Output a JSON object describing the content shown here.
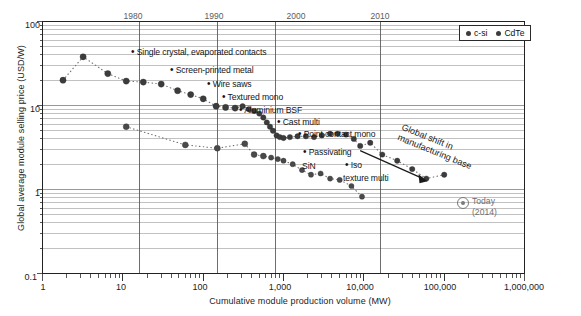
{
  "figure": {
    "background": "#ffffff",
    "frame_color": "#222222",
    "grid_color": "#8e8e8e",
    "marker_color": "#3c3c3c",
    "year_tick_color": "#5d5d5d"
  },
  "chart_data": {
    "type": "scatter",
    "title": "",
    "xlabel": "Cumulative module production volume (MW)",
    "ylabel": "Global average module selling price (USD/W)",
    "xscale": "log",
    "yscale": "log",
    "xlim": [
      1,
      1000000
    ],
    "ylim": [
      0.1,
      100
    ],
    "grid": true,
    "legend_position": "top-right",
    "xticklabels": [
      "1",
      "10",
      "100",
      "1,000",
      "10,000",
      "100,000",
      "1,000,000"
    ],
    "xtickvalues": [
      1,
      10,
      100,
      1000,
      10000,
      100000,
      1000000
    ],
    "yticklabels": [
      "0.1",
      "1",
      "10",
      "100"
    ],
    "ytickvalues": [
      0.1,
      1,
      10,
      100
    ],
    "secondary_axis": {
      "label": "year",
      "position": "top",
      "ticks": [
        {
          "label": "1980",
          "x": 16
        },
        {
          "label": "1990",
          "x": 150
        },
        {
          "label": "2000",
          "x": 800
        },
        {
          "label": "2010",
          "x": 16000
        }
      ]
    },
    "series": [
      {
        "name": "c-si",
        "color": "#3c3c3c",
        "points": [
          [
            1.8,
            20
          ],
          [
            3.2,
            38
          ],
          [
            6.5,
            24
          ],
          [
            11,
            19.5
          ],
          [
            18,
            19
          ],
          [
            30,
            18
          ],
          [
            48,
            15
          ],
          [
            70,
            13.5
          ],
          [
            100,
            12
          ],
          [
            145,
            9.8
          ],
          [
            190,
            9.5
          ],
          [
            250,
            9.3
          ],
          [
            310,
            9.8
          ],
          [
            370,
            9.0
          ],
          [
            430,
            8.6
          ],
          [
            500,
            8.0
          ],
          [
            560,
            7.2
          ],
          [
            620,
            6.3
          ],
          [
            680,
            5.6
          ],
          [
            740,
            5.0
          ],
          [
            820,
            4.4
          ],
          [
            900,
            4.2
          ],
          [
            1000,
            4.1
          ],
          [
            1200,
            4.2
          ],
          [
            1500,
            4.3
          ],
          [
            1900,
            4.3
          ],
          [
            2400,
            4.2
          ],
          [
            3000,
            4.4
          ],
          [
            3800,
            4.6
          ],
          [
            4700,
            4.6
          ],
          [
            6000,
            4.5
          ],
          [
            7500,
            4.0
          ],
          [
            9000,
            3.3
          ],
          [
            12000,
            3.6
          ],
          [
            17000,
            2.6
          ],
          [
            26000,
            2.2
          ],
          [
            40000,
            1.75
          ],
          [
            60000,
            1.35
          ],
          [
            100000,
            1.5
          ]
        ]
      },
      {
        "name": "CdTe",
        "color": "#4a4a4a",
        "points": [
          [
            11,
            5.6
          ],
          [
            60,
            3.4
          ],
          [
            150,
            3.1
          ],
          [
            330,
            3.5
          ],
          [
            430,
            2.6
          ],
          [
            560,
            2.5
          ],
          [
            700,
            2.4
          ],
          [
            850,
            2.3
          ],
          [
            1000,
            2.2
          ],
          [
            1300,
            2.0
          ],
          [
            1700,
            1.7
          ],
          [
            2200,
            1.5
          ],
          [
            2900,
            1.55
          ],
          [
            3800,
            1.35
          ],
          [
            5000,
            1.3
          ],
          [
            7000,
            1.1
          ],
          [
            9500,
            0.82
          ]
        ]
      }
    ],
    "annotations": [
      {
        "text": "Single crystal, evaporated contacts",
        "bullet": true
      },
      {
        "text": "Screen-printed metal",
        "bullet": true
      },
      {
        "text": "Wire saws",
        "bullet": true
      },
      {
        "text": "Textured mono",
        "bullet": true
      },
      {
        "text": "Aluminium BSF",
        "bullet": true
      },
      {
        "text": "Cast multi",
        "bullet": true
      },
      {
        "text": "Point contact mono",
        "bullet": true
      },
      {
        "text": "Passivating",
        "bullet": true
      },
      {
        "text": "SiN",
        "bullet": false
      },
      {
        "text": "Iso",
        "bullet": true
      },
      {
        "text": "texture multi",
        "bullet": false
      },
      {
        "text": "Global shift in",
        "bullet": false
      },
      {
        "text": "manufacturing base",
        "bullet": false
      }
    ],
    "marker_today": {
      "label": "Today",
      "sublabel": "(2014)",
      "x": 100000,
      "y": 0.6
    }
  },
  "legend": {
    "items": [
      {
        "label": "c-si"
      },
      {
        "label": "CdTe"
      }
    ]
  },
  "callouts": {
    "single_crystal": "Single crystal, evaporated contacts",
    "screen_printed": "Screen-printed metal",
    "wire_saws": "Wire saws",
    "textured_mono": "Textured mono",
    "aluminium_bsf": "Aluminium BSF",
    "cast_multi": "Cast multi",
    "point_contact": "Point contact mono",
    "passivating": "Passivating",
    "sin": "SiN",
    "iso": "Iso",
    "texture_multi": "texture multi",
    "shift_line1": "Global shift in",
    "shift_line2": "manufacturing base",
    "bullet": "•"
  },
  "today": {
    "label": "Today",
    "sublabel": "(2014)"
  },
  "axes": {
    "x_title": "Cumulative module production volume (MW)",
    "y_title": "Global average module selling price (USD/W)",
    "x_ticks": [
      "1",
      "10",
      "100",
      "1,000",
      "10,000",
      "100,000",
      "1,000,000"
    ],
    "y_ticks": [
      "100",
      "10",
      "1",
      "0.1"
    ],
    "year_ticks": [
      "1980",
      "1990",
      "2000",
      "2010"
    ]
  }
}
